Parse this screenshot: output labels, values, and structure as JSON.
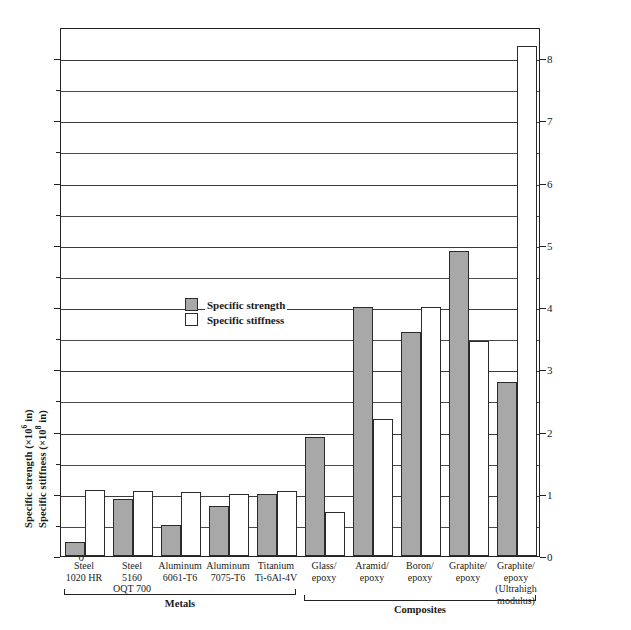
{
  "chart_data": {
    "type": "bar",
    "title": "",
    "xlabel": "",
    "ylabel_line1": "Specific strength (×10⁶ in)",
    "ylabel_line2": "Specific stiffness (×10⁸ in)",
    "ylabel_line1_pre": "Specific strength (×10",
    "ylabel_line1_sup": "6",
    "ylabel_line1_post": " in)",
    "ylabel_line2_pre": "Specific stiffness (×10",
    "ylabel_line2_sup": "8",
    "ylabel_line2_post": " in)",
    "ylim": [
      0,
      8.5
    ],
    "ytick_values": [
      0,
      1,
      2,
      3,
      4,
      5,
      6,
      7,
      8
    ],
    "ytick_labels": [
      "0",
      "1",
      "2",
      "3",
      "4",
      "5",
      "6",
      "7",
      "8"
    ],
    "minor_tick_values": [
      0.5,
      1.5,
      2.5,
      3.5,
      4.5,
      5.5,
      6.5,
      7.5
    ],
    "grid": true,
    "grid_axis": "y",
    "legend_position": "inside-upper-left",
    "categories": [
      "Steel 1020 HR",
      "Steel 5160 OQT 700",
      "Aluminum 6061-T6",
      "Aluminum 7075-T6",
      "Titanium Ti-6Al-4V",
      "Glass/epoxy",
      "Aramid/epoxy",
      "Boron/epoxy",
      "Graphite/epoxy",
      "Graphite/epoxy (Ultrahigh modulus)"
    ],
    "series": [
      {
        "name": "Specific strength",
        "color": "#a8a8a8",
        "values": [
          0.22,
          0.92,
          0.5,
          0.8,
          1.0,
          1.92,
          4.0,
          3.6,
          4.9,
          2.8
        ]
      },
      {
        "name": "Specific stiffness",
        "color": "#ffffff",
        "values": [
          1.06,
          1.04,
          1.03,
          1.0,
          1.04,
          0.7,
          2.2,
          4.0,
          3.45,
          8.2
        ]
      }
    ]
  },
  "axis": {
    "left_ticks": [
      "0",
      "1",
      "2",
      "3",
      "4",
      "5",
      "6",
      "7",
      "8"
    ],
    "right_ticks": [
      "0",
      "1",
      "2",
      "3",
      "4",
      "5",
      "6",
      "7",
      "8"
    ]
  },
  "legend": {
    "items": [
      {
        "label": "Specific strength",
        "swatch": "filled"
      },
      {
        "label": "Specific stiffness",
        "swatch": "empty"
      }
    ]
  },
  "xaxis": {
    "categories": [
      {
        "lines": [
          "Steel",
          "1020 HR"
        ]
      },
      {
        "lines": [
          "Steel",
          "5160",
          "OQT 700"
        ]
      },
      {
        "lines": [
          "Aluminum",
          "6061-T6"
        ]
      },
      {
        "lines": [
          "Aluminum",
          "7075-T6"
        ]
      },
      {
        "lines": [
          "Titanium",
          "Ti-6Al-4V"
        ]
      },
      {
        "lines": [
          "Glass/",
          "epoxy"
        ]
      },
      {
        "lines": [
          "Aramid/",
          "epoxy"
        ]
      },
      {
        "lines": [
          "Boron/",
          "epoxy"
        ]
      },
      {
        "lines": [
          "Graphite/",
          "epoxy"
        ]
      },
      {
        "lines": [
          "Graphite/",
          "epoxy",
          "(Ultrahigh",
          "modulus)"
        ]
      }
    ]
  },
  "groups": [
    {
      "label": "Metals",
      "start": 0,
      "end": 4
    },
    {
      "label": "Composites",
      "start": 5,
      "end": 9
    }
  ]
}
